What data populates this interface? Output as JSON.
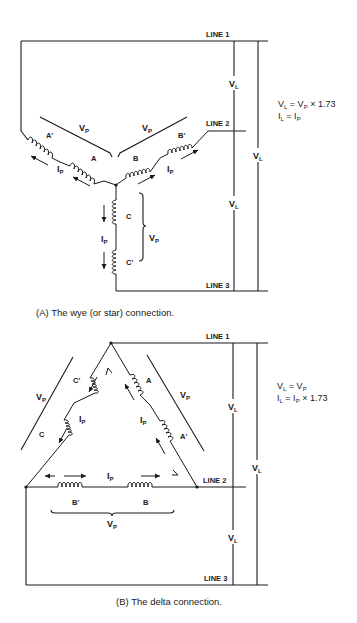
{
  "figure_a": {
    "caption": "(A) The wye (or star) connection.",
    "lines": {
      "line1": "LINE 1",
      "line2": "LINE 2",
      "line3": "LINE 3"
    },
    "coils": {
      "a": "A",
      "a_prime": "A'",
      "b": "B",
      "b_prime": "B'",
      "c": "C",
      "c_prime": "C'"
    },
    "labels": {
      "vp": "V",
      "vp_sub": "P",
      "ip": "I",
      "ip_sub": "P",
      "vl": "V",
      "vl_sub": "L"
    },
    "equations": {
      "line1": "Vₗ = Vₚ × 1.73",
      "eq1_lhs": "V",
      "eq1_lhs_sub": "L",
      "eq1_rhs": " = V",
      "eq1_rhs_sub": "P",
      "eq1_tail": " × 1.73",
      "eq2_lhs": "I",
      "eq2_lhs_sub": "L",
      "eq2_rhs": " = I",
      "eq2_rhs_sub": "P",
      "eq2_tail": ""
    }
  },
  "figure_b": {
    "caption": "(B) The delta connection.",
    "lines": {
      "line1": "LINE 1",
      "line2": "LINE 2",
      "line3": "LINE 3"
    },
    "coils": {
      "a": "A",
      "a_prime": "A'",
      "b": "B",
      "b_prime": "B'",
      "c": "C",
      "c_prime": "C'"
    },
    "labels": {
      "vp": "V",
      "vp_sub": "P",
      "ip": "I",
      "ip_sub": "P",
      "vl": "V",
      "vl_sub": "L"
    },
    "equations": {
      "eq1_lhs": "V",
      "eq1_lhs_sub": "L",
      "eq1_rhs": " = V",
      "eq1_rhs_sub": "P",
      "eq1_tail": "",
      "eq2_lhs": "I",
      "eq2_lhs_sub": "L",
      "eq2_rhs": " = I",
      "eq2_rhs_sub": "P",
      "eq2_tail": " × 1.73"
    }
  }
}
